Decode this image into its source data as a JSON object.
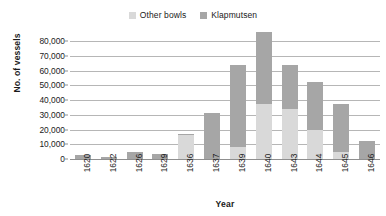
{
  "chart_data": {
    "type": "bar",
    "subtype": "stacked-column",
    "title": "",
    "xlabel": "Year",
    "ylabel": "No. of vessels",
    "categories": [
      "1620",
      "1622",
      "1626",
      "1629",
      "1636",
      "1637",
      "1639",
      "1640",
      "1643",
      "1644",
      "1645",
      "1646"
    ],
    "series": [
      {
        "name": "Other bowls",
        "color": "#d9d9d9",
        "values": [
          0,
          0,
          0,
          0,
          16500,
          0,
          8000,
          37000,
          34000,
          20000,
          5000,
          0
        ]
      },
      {
        "name": "Klapmutsen",
        "color": "#a6a6a6",
        "values": [
          2800,
          1200,
          4800,
          3200,
          500,
          31500,
          55500,
          49000,
          30000,
          32500,
          32000,
          12500
        ]
      }
    ],
    "totals": [
      2800,
      1200,
      4800,
      3200,
      17000,
      31500,
      63500,
      86000,
      64000,
      52500,
      37000,
      12500
    ],
    "ylim": [
      0,
      80000
    ],
    "ytick_step": 10000,
    "ytick_labels": [
      "80,000",
      "70,000",
      "60,000",
      "50,000",
      "40,000",
      "30,000",
      "20,000",
      "10,000",
      "0"
    ],
    "ytick_values": [
      80000,
      70000,
      60000,
      50000,
      40000,
      30000,
      20000,
      10000,
      0
    ],
    "grid": true,
    "grid_axis": "y",
    "legend_position": "top-center"
  },
  "legend": {
    "entries": [
      {
        "label": "Other bowls",
        "color": "#d9d9d9"
      },
      {
        "label": "Klapmutsen",
        "color": "#a6a6a6"
      }
    ]
  },
  "axes": {
    "y_title": "No. of vessels",
    "x_title": "Year"
  }
}
